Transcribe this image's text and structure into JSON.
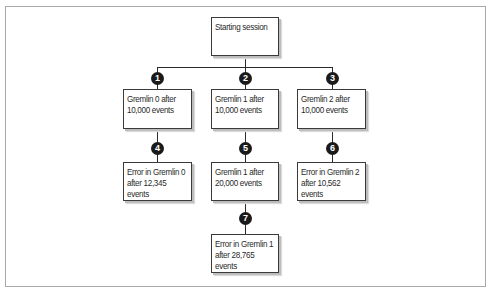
{
  "diagram": {
    "title": "",
    "root": {
      "id": "start",
      "label": "Starting session"
    },
    "nodes": [
      {
        "id": "n1",
        "step": "1",
        "label": "Gremlin 0 after\n10,000 events"
      },
      {
        "id": "n2",
        "step": "2",
        "label": "Gremlin 1 after\n10,000 events"
      },
      {
        "id": "n3",
        "step": "3",
        "label": "Gremlin 2 after\n10,000 events"
      },
      {
        "id": "n4",
        "step": "4",
        "label": "Error in Gremlin 0\nafter 12,345\nevents"
      },
      {
        "id": "n5",
        "step": "5",
        "label": "Gremlin 1 after\n20,000 events"
      },
      {
        "id": "n6",
        "step": "6",
        "label": "Error in Gremlin 2\nafter 10,562\nevents"
      },
      {
        "id": "n7",
        "step": "7",
        "label": "Error in Gremlin 1\nafter 28,765\nevents"
      }
    ],
    "edges": [
      {
        "from": "start",
        "to": "n1"
      },
      {
        "from": "start",
        "to": "n2"
      },
      {
        "from": "start",
        "to": "n3"
      },
      {
        "from": "n1",
        "to": "n4"
      },
      {
        "from": "n2",
        "to": "n5"
      },
      {
        "from": "n3",
        "to": "n6"
      },
      {
        "from": "n5",
        "to": "n7"
      }
    ]
  }
}
